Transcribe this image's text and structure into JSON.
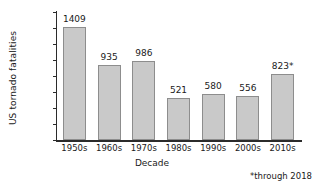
{
  "chart_data": {
    "type": "bar",
    "title": "",
    "xlabel": "Decade",
    "ylabel": "US tornado fatalities",
    "categories": [
      "1950s",
      "1960s",
      "1970s",
      "1980s",
      "1990s",
      "2000s",
      "2010s"
    ],
    "values": [
      1409,
      935,
      986,
      521,
      580,
      556,
      823
    ],
    "data_labels": [
      "1409",
      "935",
      "986",
      "521",
      "580",
      "556",
      "823*"
    ],
    "ylim": [
      0,
      1600
    ],
    "y_ticks": [
      0,
      200,
      400,
      600,
      800,
      1000,
      1200,
      1400,
      1600
    ],
    "y_tick_labels": [
      "0",
      "200",
      "400",
      "600",
      "800",
      "1,000",
      "1,200",
      "1,400",
      "1,600"
    ],
    "grid": false,
    "legend": false,
    "annotations": [
      "*through 2018"
    ],
    "bar_fill_color": "#c9c9c9",
    "bar_border_color": "#8d8d8d",
    "axis_color": "#2b2b2b",
    "background_color": "#ffffff"
  },
  "footnote": "*through 2018"
}
